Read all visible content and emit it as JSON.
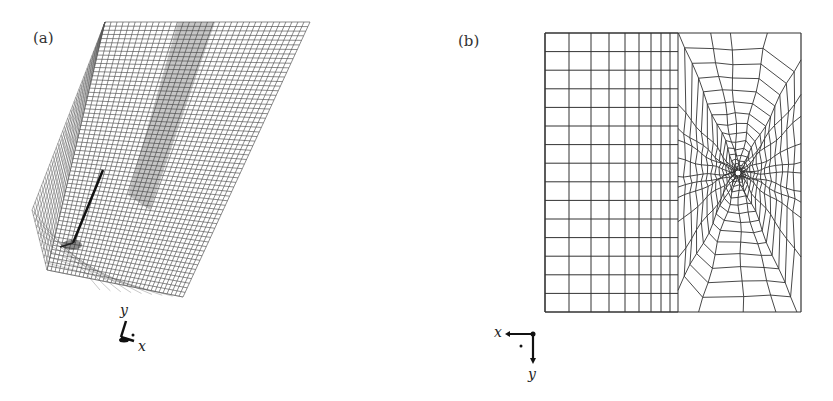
{
  "figure": {
    "panel_a": {
      "label": "(a)",
      "description": "3D hexahedral mesh of rectangular block with inclined crack/slot",
      "axes": {
        "x_label": "x",
        "y_label": "y"
      }
    },
    "panel_b": {
      "label": "(b)",
      "description": "2D cross-section mesh: structured grid (left) and unstructured radial mesh around hole (right)",
      "axes": {
        "x_label": "x",
        "y_label": "y"
      },
      "box": {
        "left": 545,
        "top": 33,
        "right": 801,
        "bottom": 312
      },
      "structured_x": [
        545,
        569,
        591,
        609,
        625,
        639,
        651,
        661,
        670,
        678
      ],
      "rows": 15,
      "hole_center": [
        738,
        173
      ],
      "hole_radius": 3,
      "radial_spokes": 28,
      "rings": 16
    }
  },
  "colors": {
    "mesh": "#333333",
    "mesh_a": "#555555",
    "background": "#ffffff"
  }
}
